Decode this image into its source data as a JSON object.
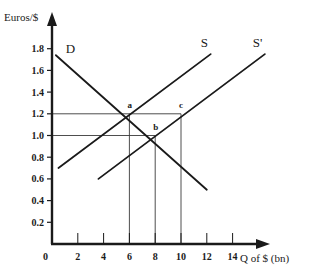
{
  "chart_data": {
    "type": "line",
    "title": "",
    "xlabel": "Q of $ (bn)",
    "ylabel": "Euros/$",
    "xlim": [
      0,
      16
    ],
    "ylim": [
      0,
      2.0
    ],
    "x_ticks": [
      2,
      4,
      6,
      8,
      10,
      12,
      14
    ],
    "x_tick_labels": [
      "2",
      "4",
      "6",
      "8",
      "10",
      "12",
      "14"
    ],
    "y_ticks": [
      0.2,
      0.4,
      0.6,
      0.8,
      1.0,
      1.2,
      1.4,
      1.6,
      1.8
    ],
    "y_tick_labels": [
      "0.2",
      "0.4",
      "0.6",
      "0.8",
      "1.0",
      "1.2",
      "1.4",
      "1.6",
      "1.8"
    ],
    "origin_label": "0",
    "grid": false,
    "legend": null,
    "series": [
      {
        "name": "D",
        "label": "D",
        "x": [
          0.3,
          12.0
        ],
        "y": [
          1.74,
          0.5
        ]
      },
      {
        "name": "S",
        "label": "S",
        "x": [
          0.5,
          12.3
        ],
        "y": [
          0.7,
          1.75
        ]
      },
      {
        "name": "S'",
        "label": "S'",
        "x": [
          3.6,
          16.5
        ],
        "y": [
          0.6,
          1.75
        ]
      }
    ],
    "points": [
      {
        "label": "a",
        "x": 6,
        "y": 1.2
      },
      {
        "label": "b",
        "x": 8,
        "y": 1.0
      },
      {
        "label": "c",
        "x": 10,
        "y": 1.2
      }
    ],
    "guide_lines": [
      {
        "type": "horizontal",
        "y": 1.2,
        "x_from": 0,
        "x_to": 10
      },
      {
        "type": "horizontal",
        "y": 1.0,
        "x_from": 0,
        "x_to": 8
      },
      {
        "type": "vertical",
        "x": 6,
        "y_from": 0,
        "y_to": 1.2
      },
      {
        "type": "vertical",
        "x": 8,
        "y_from": 0,
        "y_to": 1.0
      },
      {
        "type": "vertical",
        "x": 10,
        "y_from": 0,
        "y_to": 1.2
      }
    ]
  },
  "colors": {
    "ink": "#1a1a1a",
    "guide": "#3a3a3a",
    "background": "#ffffff"
  }
}
